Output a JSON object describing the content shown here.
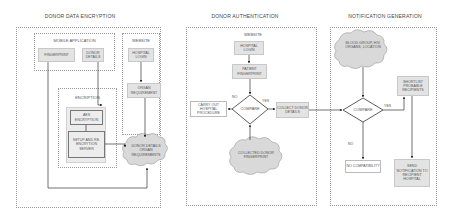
{
  "sections": {
    "encryption": {
      "title": "DONOR DATA ENCRYPTION",
      "mobile_app": {
        "label": "MOBILE APPLICATION",
        "fingerprint": "FINGERPRINT",
        "donor_details": "DONOR DETAILS"
      },
      "website": {
        "label": "WEBSITE",
        "hospital_login": "HOSPITAL LOGIN",
        "organ_requirement": "ORGAN REQUIREMENT"
      },
      "encryption_group": {
        "label": "ENCRIPTION",
        "aes": "AES ENCRYPTION",
        "setup": "SETUP AND RE-ENCRYTION SERVER"
      },
      "cloud": "DONOR DETAILS ORGAN REQUIREMENTS"
    },
    "authentication": {
      "title": "DONOR AUTHENTICATION",
      "website_label": "WEBSITE",
      "hospital_login": "HOSPITAL LOGIN",
      "patient_fingerprint": "PATIENT FINGERPRINT",
      "compare": "COMPARE",
      "no_label": "NO",
      "yes_label": "YES",
      "carry_out": "CARRY OUT HOSPITAL PROCEDURE",
      "collect_details": "COLLECT DONOR DETAILS",
      "cloud": "COLLECTED DONOR FINGERPRINT"
    },
    "notification": {
      "title": "NOTIFICATION GENERATION",
      "cloud": "BLOOD GROUP, HIV, ORGANS, LOCATION",
      "compare": "COMPARE",
      "yes_label": "YES",
      "no_label": "NO",
      "shortlist": "SHORTLIST PROBABLE RECIPIENTS",
      "no_compat": "NO COMPATIBILITY",
      "send_notification": "SEND NOTIFICATION TO RECIPIENT HOSPITAL"
    }
  },
  "colors": {
    "box_fill": "#e3e3e3",
    "cloud_fill": "#d9d9d9",
    "line": "#333333",
    "dotted_border": "#9a9a9a"
  }
}
